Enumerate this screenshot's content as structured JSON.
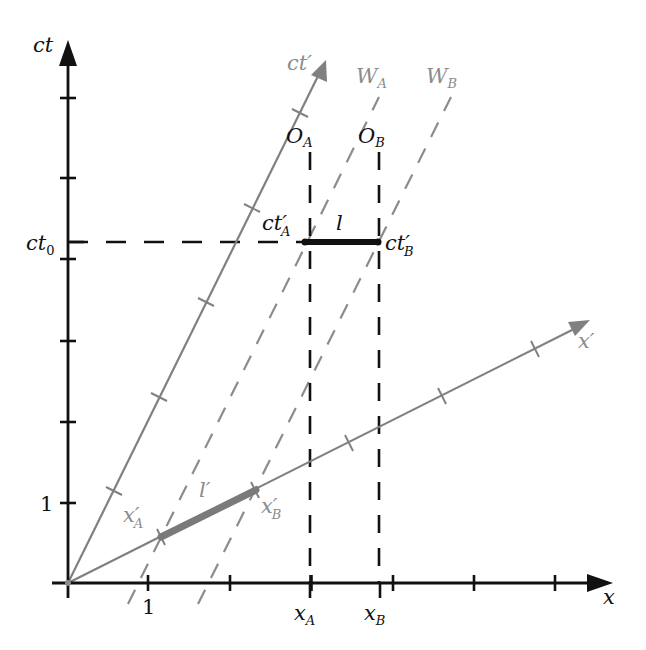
{
  "diagram": {
    "type": "spacetime-diagram",
    "colors": {
      "rest_frame": "#111111",
      "moving_frame": "#808080",
      "moving_labels": "#9a9a9a"
    },
    "axes": {
      "ct": {
        "label": "ct"
      },
      "x": {
        "label": "x"
      },
      "ct_prime": {
        "label": "ct",
        "prime": "′"
      },
      "x_prime": {
        "label": "x",
        "prime": "′"
      }
    },
    "tick_labels": {
      "x_one": "1",
      "ct_one": "1",
      "ct0": {
        "main": "ct",
        "sub": "0"
      }
    },
    "points": {
      "O_A": {
        "main": "O",
        "sub": "A"
      },
      "O_B": {
        "main": "O",
        "sub": "B"
      },
      "x_A": {
        "main": "x",
        "sub": "A"
      },
      "x_B": {
        "main": "x",
        "sub": "B"
      },
      "ct_prime_A": {
        "main": "ct",
        "prime": "′",
        "sub": "A"
      },
      "ct_prime_B": {
        "main": "ct",
        "prime": "′",
        "sub": "B"
      },
      "x_prime_A": {
        "main": "x",
        "prime": "′",
        "sub": "A"
      },
      "x_prime_B": {
        "main": "x",
        "prime": "′",
        "sub": "B"
      }
    },
    "worldlines": {
      "W_A": {
        "main": "W",
        "sub": "A"
      },
      "W_B": {
        "main": "W",
        "sub": "B"
      }
    },
    "segments": {
      "l": {
        "label": "l"
      },
      "l_prime": {
        "label": "l",
        "prime": "′"
      }
    }
  }
}
